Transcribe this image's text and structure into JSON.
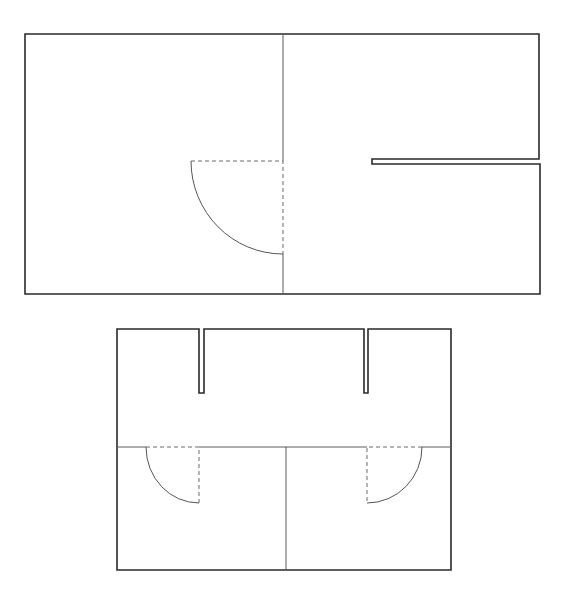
{
  "diagram": {
    "type": "floor-plan",
    "colors": {
      "background": "#ffffff",
      "wall": "#2a2a2a",
      "partition": "#5a5a5a",
      "door": "#555555"
    },
    "plans": [
      {
        "id": "plan-top",
        "outline": "25,34 539,34 539,159 372,159 372,164 540,164 540,294 25,294",
        "partitions": [
          {
            "x1": 283,
            "y1": 34,
            "x2": 283,
            "y2": 161
          },
          {
            "x1": 283,
            "y1": 254,
            "x2": 283,
            "y2": 294
          }
        ],
        "doors": [
          {
            "arc": "M191,161 A92,93 0 0,0 283,254",
            "dash": "M191,161 L283,161 L283,254"
          }
        ]
      },
      {
        "id": "plan-bottom",
        "outline": "117,329 199,329 199,393 204,393 204,329 364,329 364,393 368,393 368,329 451,329 451,570 117,570",
        "partitions": [
          {
            "x1": 117,
            "y1": 447,
            "x2": 146,
            "y2": 447
          },
          {
            "x1": 199,
            "y1": 447,
            "x2": 367,
            "y2": 447
          },
          {
            "x1": 422,
            "y1": 447,
            "x2": 451,
            "y2": 447
          },
          {
            "x1": 286,
            "y1": 447,
            "x2": 286,
            "y2": 570
          }
        ],
        "doors": [
          {
            "arc": "M146,447 A53,56 0 0,0 199,503",
            "dash": "M146,447 L199,447 L199,503"
          },
          {
            "arc": "M422,447 A55,56 0 0,1 367,503",
            "dash": "M422,447 L367,447 L367,503"
          }
        ]
      }
    ]
  }
}
